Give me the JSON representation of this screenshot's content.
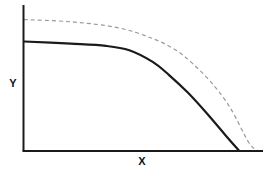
{
  "chart_data": {
    "type": "line",
    "title": "",
    "xlabel": "X",
    "ylabel": "Y",
    "xlim": [
      0,
      100
    ],
    "ylim": [
      0,
      100
    ],
    "grid": false,
    "ticks": false,
    "legend": "none",
    "series": [
      {
        "name": "frontier-outer",
        "style": "dashed",
        "color": "#9a9a9a",
        "x": [
          0,
          20,
          40,
          55,
          65,
          72,
          80,
          88,
          96,
          100
        ],
        "y": [
          90,
          88.5,
          84.5,
          77,
          69,
          60,
          47,
          30,
          6,
          0
        ]
      },
      {
        "name": "frontier-inner",
        "style": "solid",
        "color": "#1a1a1a",
        "x": [
          0,
          20,
          35,
          45,
          55,
          62,
          70,
          78,
          86,
          92
        ],
        "y": [
          75,
          73.5,
          72,
          69,
          61,
          52,
          40,
          26,
          11,
          0
        ]
      }
    ]
  }
}
